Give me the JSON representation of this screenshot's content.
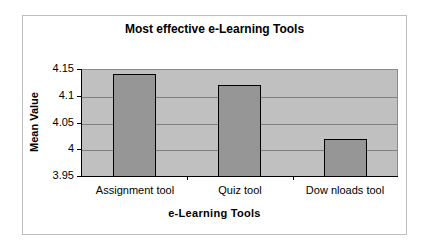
{
  "chart_data": {
    "type": "bar",
    "title": "Most effective e-Learning Tools",
    "xlabel": "e-Learning Tools",
    "ylabel": "Mean Value",
    "categories": [
      "Assignment tool",
      "Quiz tool",
      "Dow nloads tool"
    ],
    "values": [
      4.14,
      4.12,
      4.02
    ],
    "ylim": [
      3.95,
      4.15
    ],
    "yticks": [
      "4.15",
      "4.1",
      "4.05",
      "4",
      "3.95"
    ],
    "grid": true,
    "legend": "none",
    "colors": {
      "bar": "#969696",
      "plot_background": "#c0c0c0",
      "bar_border": "#000000"
    }
  }
}
